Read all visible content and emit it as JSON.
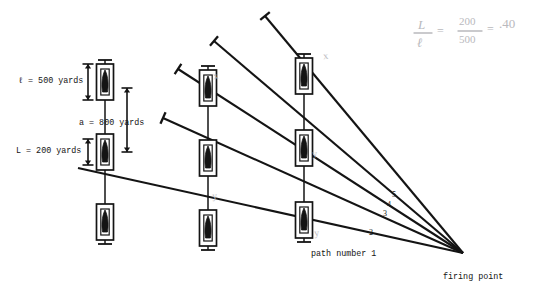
{
  "figure": {
    "background_color": "#ffffff",
    "ink_color": "#141414",
    "pencil_color": "#b9b9bd"
  },
  "dimension_labels": [
    {
      "name": "ell-500",
      "text": "ℓ = 500 yards",
      "x": 18,
      "y": 76
    },
    {
      "name": "a-800",
      "text": "a = 800 yards",
      "x": 79,
      "y": 118
    },
    {
      "name": "L-200",
      "text": "L = 200 yards",
      "x": 16,
      "y": 146
    }
  ],
  "path_numbers": [
    {
      "name": "path-5",
      "text": "5",
      "x": 392,
      "y": 190
    },
    {
      "name": "path-4",
      "text": "4",
      "x": 387,
      "y": 200
    },
    {
      "name": "path-3",
      "text": "3",
      "x": 383,
      "y": 209
    },
    {
      "name": "path-2",
      "text": "2",
      "x": 369,
      "y": 228
    }
  ],
  "path_number_one": {
    "text": "path number 1",
    "x": 311,
    "y": 249
  },
  "firing_point": {
    "text": "firing point",
    "x": 443,
    "y": 272
  },
  "handwritten_formula": {
    "numerator_left": "L",
    "denominator_left": "ℓ",
    "equals_1": "=",
    "numerator_right": "200",
    "denominator_right": "500",
    "equals_2": "=",
    "result": ".40"
  },
  "pencil_marks": [
    {
      "name": "mark-x-col2-top",
      "text": "x",
      "x": 213,
      "y": 70
    },
    {
      "name": "mark-y-col2-bottom",
      "text": "y",
      "x": 212,
      "y": 190
    },
    {
      "name": "mark-x-col3-top",
      "text": "x",
      "x": 323,
      "y": 50
    },
    {
      "name": "mark-y-col3-mid",
      "text": "y",
      "x": 312,
      "y": 148
    },
    {
      "name": "mark-y-col3-bottom",
      "text": "y",
      "x": 314,
      "y": 227
    }
  ],
  "target_columns": [
    {
      "name": "column-1",
      "x": 105,
      "targets": [
        82,
        152,
        222
      ]
    },
    {
      "name": "column-2",
      "x": 208,
      "targets": [
        88,
        158,
        228
      ]
    },
    {
      "name": "column-3",
      "x": 304,
      "targets": [
        76,
        148,
        220
      ]
    }
  ],
  "flight_paths": [
    {
      "name": "path-1",
      "start_x": 78,
      "start_y": 168,
      "end_x": 463,
      "end_y": 253
    },
    {
      "name": "path-2",
      "start_x": 163,
      "start_y": 118,
      "end_x": 463,
      "end_y": 253
    },
    {
      "name": "path-3",
      "start_x": 178,
      "start_y": 69,
      "end_x": 463,
      "end_y": 253
    },
    {
      "name": "path-4",
      "start_x": 214,
      "start_y": 41,
      "end_x": 463,
      "end_y": 253
    },
    {
      "name": "path-5",
      "start_x": 265,
      "start_y": 16,
      "end_x": 463,
      "end_y": 253
    }
  ]
}
